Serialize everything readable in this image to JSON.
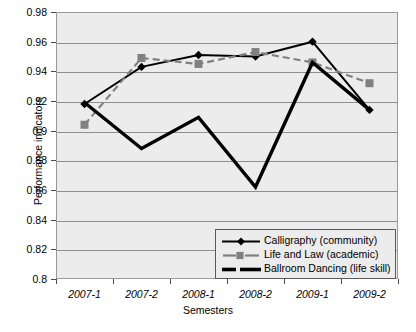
{
  "chart_data": {
    "type": "line",
    "title": "",
    "xlabel": "Semesters",
    "ylabel": "Performance indicators",
    "categories": [
      "2007-1",
      "2007-2",
      "2008-1",
      "2008-2",
      "2009-1",
      "2009-2"
    ],
    "ylim": [
      0.8,
      0.98
    ],
    "ytick_step": 0.02,
    "ytick_labels": [
      "0.98",
      "0.96",
      "0.94",
      "0.92",
      "0.9",
      "0.88",
      "0.86",
      "0.84",
      "0.82",
      "0.8"
    ],
    "ytick_values": [
      0.98,
      0.96,
      0.94,
      0.92,
      0.9,
      0.88,
      0.86,
      0.84,
      0.82,
      0.8
    ],
    "grid": true,
    "legend_position": "bottom-right",
    "series": [
      {
        "name": "Calligraphy (community)",
        "values": [
          0.918,
          0.943,
          0.951,
          0.95,
          0.96,
          0.914
        ],
        "color": "#000000",
        "marker": "diamond",
        "dash": "solid"
      },
      {
        "name": "Life and Law (academic)",
        "values": [
          0.904,
          0.949,
          0.945,
          0.953,
          0.946,
          0.932
        ],
        "color": "#808080",
        "marker": "square",
        "dash": "dashed"
      },
      {
        "name": "Ballroom Dancing (life skill)",
        "values": [
          0.919,
          0.888,
          0.909,
          0.862,
          0.946,
          0.914
        ],
        "color": "#000000",
        "marker": "none",
        "dash": "solid-thick"
      }
    ]
  },
  "colors": {
    "plot_background": "#ececec",
    "gridline": "#8f8f8f",
    "axis": "#4a4a4a",
    "series_black": "#000000",
    "series_gray": "#808080",
    "legend_background": "#ececec",
    "legend_border": "#5a5a5a"
  }
}
